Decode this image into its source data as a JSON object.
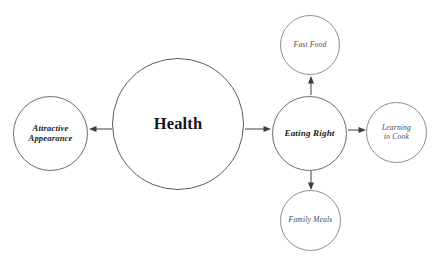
{
  "diagram": {
    "type": "concept-map",
    "title_node": "Health",
    "nodes": [
      {
        "id": "health",
        "label": "Health",
        "role": "central",
        "cx": 178,
        "cy": 124,
        "r": 66,
        "font_size": 16.5
      },
      {
        "id": "attractive-appearance",
        "label": "Attractive\nAppearance",
        "role": "primary",
        "cx": 50.5,
        "cy": 133,
        "r": 37.5,
        "font_size": 8.6
      },
      {
        "id": "eating-right",
        "label": "Eating Right",
        "role": "primary",
        "cx": 309.5,
        "cy": 133,
        "r": 37.5,
        "font_size": 9.1
      },
      {
        "id": "fast-food",
        "label": "Fast Food",
        "role": "leaf",
        "cx": 310,
        "cy": 45,
        "r": 30,
        "font_size": 7.6
      },
      {
        "id": "family-meals",
        "label": "Family Meals",
        "role": "leaf",
        "cx": 310.5,
        "cy": 220,
        "r": 30.5,
        "font_size": 7.6
      },
      {
        "id": "learning-to-cook",
        "label": "Learning\nto Cook",
        "role": "leaf",
        "cx": 396.5,
        "cy": 132.5,
        "r": 30.5,
        "font_size": 7.6
      }
    ],
    "edges": [
      {
        "id": "health-to-attractive-appearance",
        "from": "health",
        "to": "attractive-appearance",
        "direction": "left",
        "x1": 112,
        "y1": 129,
        "x2": 89,
        "y2": 129
      },
      {
        "id": "health-to-eating-right",
        "from": "health",
        "to": "eating-right",
        "direction": "right",
        "x1": 245,
        "y1": 129,
        "x2": 271,
        "y2": 129
      },
      {
        "id": "eating-right-to-fast-food",
        "from": "eating-right",
        "to": "fast-food",
        "direction": "up",
        "x1": 311,
        "y1": 95,
        "x2": 311,
        "y2": 76
      },
      {
        "id": "eating-right-to-family-meals",
        "from": "eating-right",
        "to": "family-meals",
        "direction": "down",
        "x1": 311,
        "y1": 171,
        "x2": 311,
        "y2": 190
      },
      {
        "id": "eating-right-to-learning-to-cook",
        "from": "eating-right",
        "to": "learning-to-cook",
        "direction": "right",
        "x1": 348,
        "y1": 130,
        "x2": 366,
        "y2": 130
      }
    ],
    "colors": {
      "background": "#ffffff",
      "central_stroke": "#5a5a66",
      "primary_stroke": "#6b6b77",
      "leaf_stroke": "#8d8d99",
      "edge_stroke": "#3c3c46",
      "central_text": "#15151a",
      "primary_text": "#1c1c22",
      "leaf_text": "#4a4a55"
    }
  }
}
